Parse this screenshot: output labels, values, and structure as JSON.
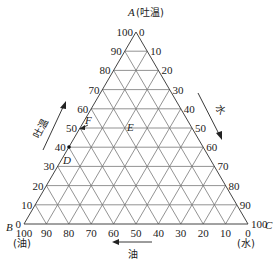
{
  "diagram": {
    "type": "ternary-phase-diagram",
    "vertices": {
      "A": {
        "letter": "A",
        "component": "(吐温)"
      },
      "B": {
        "letter": "B",
        "component": "(油)"
      },
      "C": {
        "letter": "C",
        "component": "(水)"
      }
    },
    "axes": {
      "left": {
        "label": "吐温",
        "ticks": [
          "0",
          "10",
          "20",
          "30",
          "40",
          "50",
          "60",
          "70",
          "80",
          "90",
          "100"
        ]
      },
      "right": {
        "label": "水",
        "ticks": [
          "0",
          "10",
          "20",
          "30",
          "40",
          "50",
          "60",
          "70",
          "80",
          "90",
          "100"
        ]
      },
      "bottom": {
        "label": "油",
        "ticks": [
          "100",
          "90",
          "80",
          "70",
          "60",
          "50",
          "40",
          "30",
          "20",
          "10",
          "0"
        ]
      }
    },
    "points": [
      {
        "label": "D",
        "position": "left edge at 40"
      },
      {
        "label": "F",
        "position": "left edge at 50"
      },
      {
        "label": "E",
        "position": "interior, 50 level"
      }
    ],
    "grid_step": 10,
    "line_color": "#555555"
  }
}
